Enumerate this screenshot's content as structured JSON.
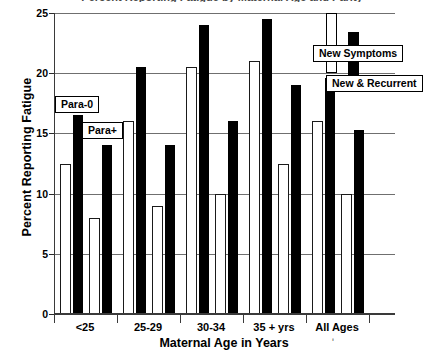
{
  "chart_data": {
    "type": "bar",
    "title": "Percent Reporting Fatigue by Maternal Age and Parity",
    "xlabel": "Maternal Age in Years",
    "ylabel": "Percent Reporting Fatigue",
    "categories": [
      "<25",
      "25-29",
      "30-34",
      "35 + yrs",
      "All Ages"
    ],
    "ylim": [
      0,
      25
    ],
    "yticks": [
      "0",
      "5",
      "10",
      "15",
      "20",
      "25"
    ],
    "grid": true,
    "legend_position": "upper-right",
    "series": [
      {
        "name": "Para-0 / New Symptoms",
        "parity": "Para-0",
        "symptom_type": "New Symptoms",
        "style": "open",
        "values": [
          12.5,
          16.0,
          20.5,
          21.0,
          16.0
        ]
      },
      {
        "name": "Para-0 / New & Recurrent",
        "parity": "Para-0",
        "symptom_type": "New & Recurrent",
        "style": "solid",
        "values": [
          16.5,
          20.5,
          24.0,
          24.5,
          19.6
        ]
      },
      {
        "name": "Para+ / New Symptoms",
        "parity": "Para+",
        "symptom_type": "New Symptoms",
        "style": "open",
        "values": [
          8.0,
          9.0,
          10.0,
          12.5,
          10.0
        ]
      },
      {
        "name": "Para+ / New & Recurrent",
        "parity": "Para+",
        "symptom_type": "New & Recurrent",
        "style": "solid",
        "values": [
          14.0,
          14.0,
          16.0,
          19.0,
          15.3
        ]
      }
    ],
    "annotations": [
      {
        "label": "Para-0",
        "target": "group1-first-pair"
      },
      {
        "label": "Para+",
        "target": "group1-second-pair"
      }
    ],
    "legend": [
      {
        "label": "New Symptoms",
        "style": "open",
        "color": "#ffffff"
      },
      {
        "label": "New & Recurrent",
        "style": "solid",
        "color": "#000000"
      }
    ],
    "colors": {
      "open_fill": "#ffffff",
      "open_stroke": "#1a1a1a",
      "solid_fill": "#000000",
      "grid": "#6f6f6f",
      "axis": "#3a3a3a"
    }
  }
}
